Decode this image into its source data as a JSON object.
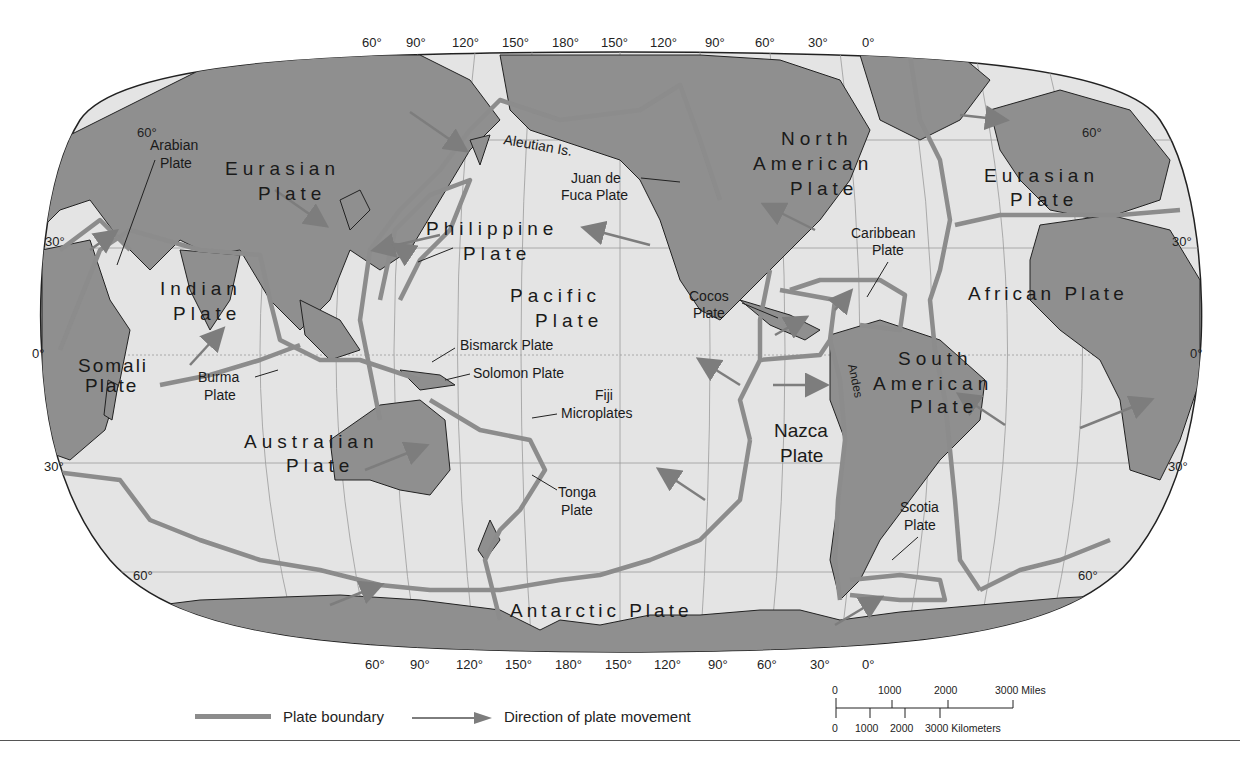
{
  "map": {
    "type": "world tectonic plates map (Robinson-like projection)",
    "colors": {
      "ocean": "#e4e4e4",
      "land": "#8f8f8f",
      "boundary": "#8c8c8c",
      "arrow": "#7d7d7d",
      "graticule": "#9a9a9a",
      "text": "#1a1a1a"
    },
    "top_longitude_labels": [
      "60°",
      "90°",
      "120°",
      "150°",
      "180°",
      "150°",
      "120°",
      "90°",
      "60°",
      "30°",
      "0°"
    ],
    "bottom_longitude_labels": [
      "60°",
      "90°",
      "120°",
      "150°",
      "180°",
      "150°",
      "120°",
      "90°",
      "60°",
      "30°",
      "0°"
    ],
    "left_latitude_labels": [
      "60°",
      "30°",
      "0°",
      "30°",
      "60°"
    ],
    "right_latitude_labels": [
      "60°",
      "30°",
      "0°",
      "30°",
      "60°"
    ],
    "plates": {
      "eurasian_west": [
        "Eurasian",
        "Plate"
      ],
      "eurasian_east": [
        "Eurasian",
        "Plate"
      ],
      "arabian": [
        "Arabian",
        "Plate"
      ],
      "indian": [
        "Indian",
        "Plate"
      ],
      "somali": [
        "Somali",
        "Plate"
      ],
      "burma": [
        "Burma",
        "Plate"
      ],
      "australian": [
        "Australian",
        "Plate"
      ],
      "philippine": [
        "Philippine",
        "Plate"
      ],
      "pacific": [
        "Pacific",
        "Plate"
      ],
      "bismarck": "Bismarck Plate",
      "solomon": "Solomon Plate",
      "fiji": [
        "Fiji",
        "Microplates"
      ],
      "tonga": [
        "Tonga",
        "Plate"
      ],
      "juan_de_fuca": [
        "Juan de",
        "Fuca Plate"
      ],
      "north_american": [
        "North",
        "American",
        "Plate"
      ],
      "caribbean": [
        "Caribbean",
        "Plate"
      ],
      "cocos": [
        "Cocos",
        "Plate"
      ],
      "nazca": [
        "Nazca",
        "Plate"
      ],
      "south_american": [
        "South",
        "American",
        "Plate"
      ],
      "scotia": [
        "Scotia",
        "Plate"
      ],
      "african": "African Plate",
      "antarctic": "Antarctic Plate"
    },
    "features": {
      "aleutian": "Aleutian Is.",
      "andes": "Andes"
    }
  },
  "legend": {
    "boundary_label": "Plate boundary",
    "movement_label": "Direction of plate movement"
  },
  "scale_bar": {
    "miles_ticks": [
      "0",
      "1000",
      "2000",
      "3000 Miles"
    ],
    "km_ticks": [
      "0",
      "1000",
      "2000",
      "3000 Kilometers"
    ]
  }
}
